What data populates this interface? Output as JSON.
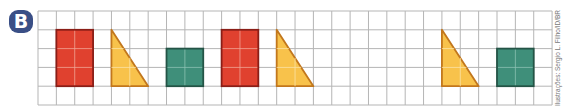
{
  "badge": {
    "label": "B"
  },
  "credit": "Ilustrações: Sergio L. Filho/ID/BR",
  "grid": {
    "origin_x": 38,
    "origin_y": 11,
    "cell_w": 18.36,
    "cell_h": 18.8,
    "cols": 28,
    "rows": 5,
    "line_color": "#b5b5b5"
  },
  "colors": {
    "red_fill": "#e0412f",
    "red_stroke": "#8a1e17",
    "yellow_fill": "#f8c24b",
    "yellow_stroke": "#c2771d",
    "green_fill": "#3f8f7a",
    "green_stroke": "#245446",
    "inner_line": "#f2d8d0"
  },
  "shapes": [
    {
      "type": "rectangle",
      "color": "red",
      "col": 1,
      "row": 1,
      "w": 2,
      "h": 3
    },
    {
      "type": "right-triangle",
      "color": "yellow",
      "col": 4,
      "row": 1,
      "w": 2,
      "h": 3
    },
    {
      "type": "square",
      "color": "green",
      "col": 7,
      "row": 2,
      "w": 2,
      "h": 2
    },
    {
      "type": "rectangle",
      "color": "red",
      "col": 10,
      "row": 1,
      "w": 2,
      "h": 3
    },
    {
      "type": "right-triangle",
      "color": "yellow",
      "col": 13,
      "row": 1,
      "w": 2,
      "h": 3
    },
    {
      "type": "right-triangle",
      "color": "yellow",
      "col": 22,
      "row": 1,
      "w": 2,
      "h": 3
    },
    {
      "type": "square",
      "color": "green",
      "col": 25,
      "row": 2,
      "w": 2,
      "h": 2
    }
  ]
}
